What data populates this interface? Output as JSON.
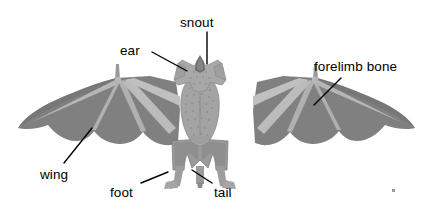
{
  "figure": {
    "background_color": "#ffffff",
    "text_color": "#000000",
    "leader_line_color": "#000000",
    "colors": {
      "wing_membrane": "#808080",
      "wing_membrane_shadow": "#6f6f6f",
      "bone": "#aeaeae",
      "bone_light": "#c0c0c0",
      "body_fur": "#a3a3a3",
      "body_fur_dark": "#8a8a8a",
      "head": "#a8a8a8",
      "snout": "#6d6d6d",
      "tail_membrane": "#9a9a9a",
      "speck": "#9b9b9b"
    }
  },
  "labels": [
    {
      "id": "snout",
      "text": "snout",
      "x": 180,
      "y": 16
    },
    {
      "id": "ear",
      "text": "ear",
      "x": 120,
      "y": 44
    },
    {
      "id": "forelimb",
      "text": "forelimb bone",
      "x": 314,
      "y": 60
    },
    {
      "id": "wing",
      "text": "wing",
      "x": 40,
      "y": 168
    },
    {
      "id": "foot",
      "text": "foot",
      "x": 110,
      "y": 186
    },
    {
      "id": "tail",
      "text": "tail",
      "x": 214,
      "y": 186
    }
  ],
  "leader_lines": [
    {
      "id": "snout",
      "x1": 207,
      "y1": 32,
      "x2": 207,
      "y2": 64
    },
    {
      "id": "ear",
      "x1": 152,
      "y1": 52,
      "x2": 187,
      "y2": 71
    },
    {
      "id": "forelimb",
      "x1": 341,
      "y1": 78,
      "x2": 314,
      "y2": 105
    },
    {
      "id": "wing",
      "x1": 64,
      "y1": 163,
      "x2": 92,
      "y2": 128
    },
    {
      "id": "foot",
      "x1": 141,
      "y1": 183,
      "x2": 168,
      "y2": 172
    },
    {
      "id": "tail",
      "x1": 212,
      "y1": 183,
      "x2": 192,
      "y2": 170
    }
  ]
}
